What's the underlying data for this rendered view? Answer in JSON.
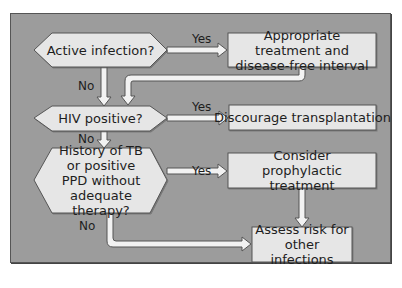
{
  "colors": {
    "panel_bg": "#9c9c9c",
    "node_fill": "#e6e6e6",
    "node_stroke": "#555555",
    "arrow_fill": "#f2f2f2",
    "arrow_stroke": "#555555",
    "text": "#1e1e1e"
  },
  "decisions": [
    {
      "id": "active-infection",
      "text": "Active infection?"
    },
    {
      "id": "hiv-positive",
      "text": "HIV positive?"
    },
    {
      "id": "history-tb",
      "text": "History of TB or positive PPD without adequate therapy?"
    }
  ],
  "outcomes": [
    {
      "id": "appropriate-treatment",
      "text": "Appropriate treatment and disease-free interval"
    },
    {
      "id": "discourage-transplantation",
      "text": "Discourage transplantation"
    },
    {
      "id": "consider-prophylactic",
      "text": "Consider prophylactic treatment"
    },
    {
      "id": "assess-risk",
      "text": "Assess risk for other infections"
    }
  ],
  "edge_labels": {
    "yes_1": "Yes",
    "no_1": "No",
    "yes_2": "Yes",
    "no_2": "No",
    "yes_3": "Yes",
    "no_3": "No"
  }
}
